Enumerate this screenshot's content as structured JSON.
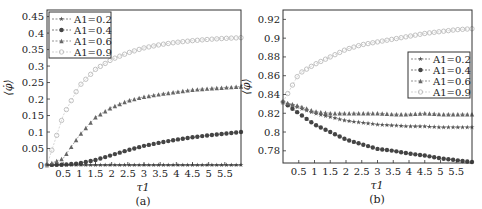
{
  "chart_data": [
    {
      "type": "line",
      "panel_label": "(a)",
      "xlabel": "τ1",
      "ylabel": "⟨φ̇⟩",
      "xlim": [
        0,
        6
      ],
      "ylim": [
        0,
        0.47
      ],
      "xticks": [
        "0.5",
        "1",
        "1.5",
        "2",
        "2.5",
        "3",
        "3.5",
        "4",
        "4.5",
        "5",
        "5.5"
      ],
      "yticks": [
        "0",
        "0.05",
        "0.1",
        "0.15",
        "0.2",
        "0.25",
        "0.3",
        "0.35",
        "0.4",
        "0.45"
      ],
      "legend_position": "upper left",
      "x": [
        0,
        0.5,
        1,
        1.5,
        2,
        2.5,
        3,
        3.5,
        4,
        4.5,
        5,
        5.5,
        6
      ],
      "series": [
        {
          "name": "A1=0.2",
          "marker": "star",
          "color": "#555555",
          "values": [
            0,
            0,
            0,
            0,
            0,
            0,
            0,
            0,
            0,
            0,
            0,
            0,
            0
          ]
        },
        {
          "name": "A1=0.4",
          "marker": "pentagon",
          "color": "#444444",
          "values": [
            0,
            0.001,
            0.005,
            0.015,
            0.03,
            0.045,
            0.058,
            0.068,
            0.077,
            0.084,
            0.09,
            0.095,
            0.1
          ]
        },
        {
          "name": "A1=0.6",
          "marker": "triangle",
          "color": "#666666",
          "values": [
            0,
            0.02,
            0.09,
            0.145,
            0.175,
            0.195,
            0.207,
            0.215,
            0.222,
            0.228,
            0.232,
            0.235,
            0.238
          ]
        },
        {
          "name": "A1=0.9",
          "marker": "circle",
          "color": "#bbbbbb",
          "values": [
            0,
            0.15,
            0.24,
            0.29,
            0.32,
            0.34,
            0.355,
            0.365,
            0.372,
            0.377,
            0.381,
            0.384,
            0.386
          ]
        }
      ]
    },
    {
      "type": "line",
      "panel_label": "(b)",
      "xlabel": "τ1",
      "ylabel": "⟨φ̇⟩",
      "xlim": [
        0,
        6
      ],
      "ylim": [
        0.767,
        0.93
      ],
      "xticks": [
        "0.5",
        "1",
        "1.5",
        "2",
        "2.5",
        "3",
        "3.5",
        "4",
        "4.5",
        "5",
        "5.5"
      ],
      "yticks": [
        "0.78",
        "0.8",
        "0.82",
        "0.84",
        "0.86",
        "0.88",
        "0.9",
        "0.92"
      ],
      "legend_position": "center right",
      "x": [
        0,
        0.5,
        1,
        1.5,
        2,
        2.5,
        3,
        3.5,
        4,
        4.5,
        5,
        5.5,
        6
      ],
      "series": [
        {
          "name": "A1=0.2",
          "marker": "star",
          "color": "#555555",
          "values": [
            0.832,
            0.826,
            0.82,
            0.816,
            0.812,
            0.81,
            0.808,
            0.807,
            0.806,
            0.806,
            0.805,
            0.805,
            0.805
          ]
        },
        {
          "name": "A1=0.4",
          "marker": "pentagon",
          "color": "#444444",
          "values": [
            0.832,
            0.82,
            0.808,
            0.8,
            0.792,
            0.787,
            0.782,
            0.78,
            0.777,
            0.775,
            0.772,
            0.77,
            0.768
          ]
        },
        {
          "name": "A1=0.6",
          "marker": "triangle",
          "color": "#666666",
          "values": [
            0.832,
            0.828,
            0.822,
            0.82,
            0.82,
            0.82,
            0.82,
            0.819,
            0.819,
            0.82,
            0.819,
            0.819,
            0.819
          ]
        },
        {
          "name": "A1=0.9",
          "marker": "circle",
          "color": "#bbbbbb",
          "values": [
            0.832,
            0.862,
            0.872,
            0.88,
            0.888,
            0.893,
            0.896,
            0.899,
            0.902,
            0.905,
            0.907,
            0.909,
            0.91
          ]
        }
      ]
    }
  ]
}
